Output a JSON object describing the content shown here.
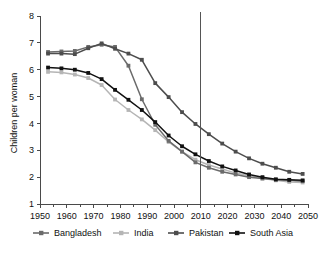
{
  "chart_data": {
    "type": "line",
    "title": "",
    "xlabel": "",
    "ylabel": "Children per woman",
    "xlim": [
      1950,
      2050
    ],
    "ylim": [
      1,
      8
    ],
    "ytick_labels": [
      "1",
      "2",
      "3",
      "4",
      "5",
      "6",
      "7",
      "8"
    ],
    "yticks": [
      1,
      2,
      3,
      4,
      5,
      6,
      7,
      8
    ],
    "xtick_labels": [
      "1950",
      "1960",
      "1970",
      "1980",
      "1990",
      "2000",
      "2010",
      "2020",
      "2030",
      "2040",
      "2050"
    ],
    "xticks": [
      1950,
      1960,
      1970,
      1980,
      1990,
      2000,
      2010,
      2020,
      2030,
      2040,
      2050
    ],
    "xminor_step": 5,
    "grid": false,
    "legend_position": "bottom",
    "annotations": [
      {
        "name": "projection-divider",
        "type": "vline",
        "x": 2010,
        "label": ""
      }
    ],
    "x": [
      1953,
      1958,
      1963,
      1968,
      1973,
      1978,
      1983,
      1988,
      1993,
      1998,
      2003,
      2008,
      2013,
      2018,
      2023,
      2028,
      2033,
      2038,
      2043,
      2048
    ],
    "series": [
      {
        "name": "Bangladesh",
        "color": "#6b6b6b",
        "marker": "square",
        "values": [
          6.66,
          6.68,
          6.7,
          6.85,
          6.93,
          6.85,
          6.15,
          4.9,
          3.95,
          3.35,
          2.95,
          2.55,
          2.35,
          2.2,
          2.1,
          2.0,
          1.95,
          1.9,
          1.88,
          1.85
        ]
      },
      {
        "name": "India",
        "color": "#b5b5b5",
        "marker": "square",
        "values": [
          5.92,
          5.9,
          5.82,
          5.69,
          5.43,
          4.89,
          4.5,
          4.15,
          3.75,
          3.31,
          2.95,
          2.65,
          2.45,
          2.3,
          2.15,
          2.05,
          1.95,
          1.88,
          1.82,
          1.8
        ]
      },
      {
        "name": "Pakistan",
        "color": "#4d4d4d",
        "marker": "square",
        "values": [
          6.6,
          6.6,
          6.58,
          6.8,
          6.98,
          6.78,
          6.6,
          6.37,
          5.5,
          4.98,
          4.42,
          3.98,
          3.6,
          3.25,
          2.95,
          2.7,
          2.5,
          2.35,
          2.2,
          2.12
        ]
      },
      {
        "name": "South Asia",
        "color": "#111111",
        "marker": "square",
        "values": [
          6.08,
          6.05,
          6.0,
          5.88,
          5.65,
          5.25,
          4.88,
          4.5,
          4.05,
          3.55,
          3.15,
          2.85,
          2.6,
          2.4,
          2.25,
          2.1,
          2.0,
          1.92,
          1.9,
          1.88
        ]
      }
    ]
  },
  "legend": {
    "items": [
      {
        "label": "Bangladesh",
        "color": "#6b6b6b"
      },
      {
        "label": "India",
        "color": "#b5b5b5"
      },
      {
        "label": "Pakistan",
        "color": "#4d4d4d"
      },
      {
        "label": "South Asia",
        "color": "#111111"
      }
    ]
  }
}
